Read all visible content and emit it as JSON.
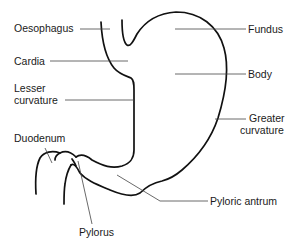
{
  "diagram": {
    "stroke_color": "#111111",
    "labels": {
      "oesophagus": "Oesophagus",
      "cardia": "Cardia",
      "lesser_curvature_1": "Lesser",
      "lesser_curvature_2": "curvature",
      "duodenum": "Duodenum",
      "pylorus": "Pylorus",
      "fundus": "Fundus",
      "body": "Body",
      "greater_curvature_1": "Greater",
      "greater_curvature_2": "curvature",
      "pyloric_antrum": "Pyloric antrum"
    }
  }
}
